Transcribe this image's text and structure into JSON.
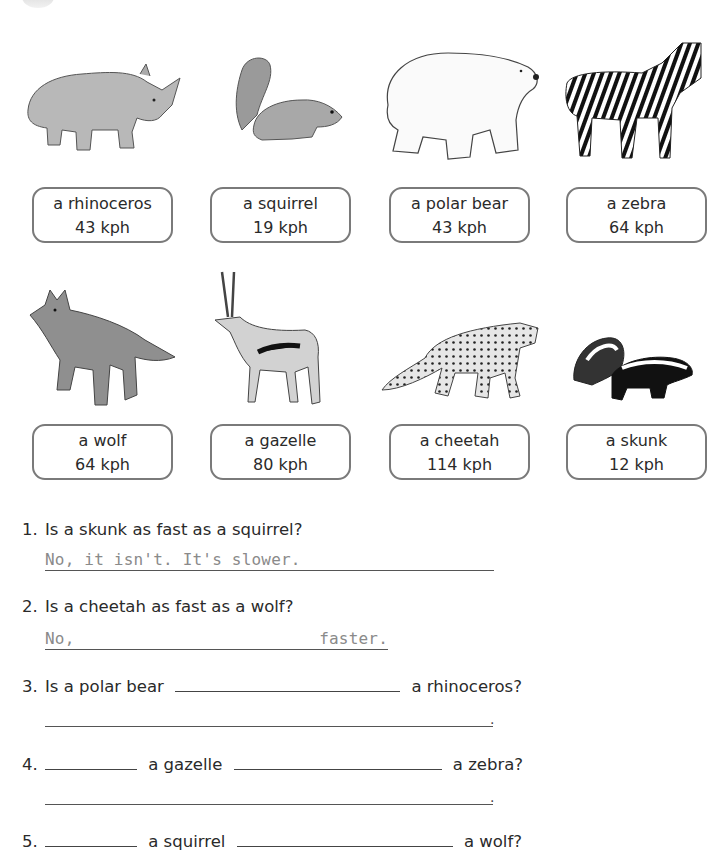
{
  "worksheet": {
    "animals": [
      {
        "name": "a rhinoceros",
        "speed": "43 kph",
        "icon": "rhinoceros-illustration"
      },
      {
        "name": "a squirrel",
        "speed": "19 kph",
        "icon": "squirrel-illustration"
      },
      {
        "name": "a polar bear",
        "speed": "43 kph",
        "icon": "polar-bear-illustration"
      },
      {
        "name": "a zebra",
        "speed": "64 kph",
        "icon": "zebra-illustration"
      },
      {
        "name": "a wolf",
        "speed": "64 kph",
        "icon": "wolf-illustration"
      },
      {
        "name": "a gazelle",
        "speed": "80 kph",
        "icon": "gazelle-illustration"
      },
      {
        "name": "a cheetah",
        "speed": "114 kph",
        "icon": "cheetah-illustration"
      },
      {
        "name": "a skunk",
        "speed": "12 kph",
        "icon": "skunk-illustration"
      }
    ],
    "questions": [
      {
        "number": "1.",
        "text": "Is a skunk as fast as a squirrel?",
        "answer": "No, it isn't. It's slower."
      },
      {
        "number": "2.",
        "text": "Is a cheetah as fast as a wolf?",
        "answer_start": "No,",
        "answer_end": "faster."
      },
      {
        "number": "3.",
        "text_start": "Is a polar bear",
        "text_end": "a rhinoceros?",
        "answer_end": "."
      },
      {
        "number": "4.",
        "text_mid": "a gazelle",
        "text_end": "a zebra?",
        "answer_end": "."
      },
      {
        "number": "5.",
        "text_mid": "a squirrel",
        "text_end": "a wolf?"
      }
    ]
  }
}
